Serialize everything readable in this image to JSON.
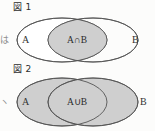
{
  "page": {
    "background_color": "#fdfdfd",
    "ink_color": "#4a4a4a",
    "shade_color": "#cfcfcf"
  },
  "figures": [
    {
      "id": "figure-1",
      "caption": "図 1",
      "set_left_label": "A",
      "set_right_label": "B",
      "region_label": "A∩B",
      "shaded_region": "intersection",
      "edge_fragment": "は"
    },
    {
      "id": "figure-2",
      "caption": "図 2",
      "set_left_label": "A",
      "set_right_label": "B",
      "region_label": "A∪B",
      "shaded_region": "union",
      "edge_fragment": "ヽ"
    }
  ]
}
